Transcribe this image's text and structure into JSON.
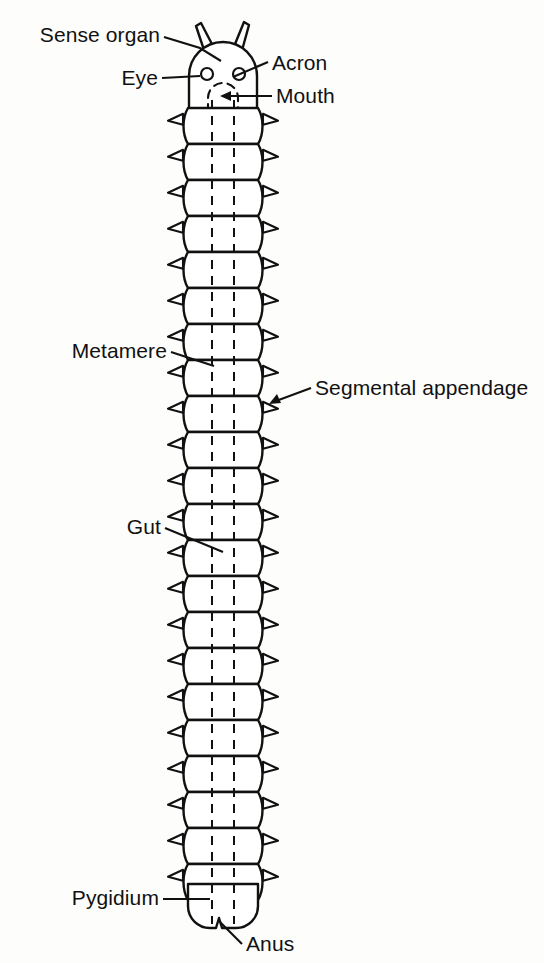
{
  "figure": {
    "title": "Generalized segmented arthropod body plan",
    "organism": "generalized metameric arthropod",
    "background_color": "#fdfdfc",
    "ink_color": "#111111",
    "fill_color": "#ffffff"
  },
  "labels": {
    "sense_organ": "Sense organ",
    "acron": "Acron",
    "eye": "Eye",
    "mouth": "Mouth",
    "metamere": "Metamere",
    "segmental_appendage": "Segmental appendage",
    "gut": "Gut",
    "pygidium": "Pygidium",
    "anus": "Anus"
  },
  "anatomy": {
    "parts": [
      {
        "name": "sense-organ",
        "label": "Sense organ",
        "side": "left",
        "count": 2,
        "description": "paired tapered antenna-like projections on top of the acron"
      },
      {
        "name": "acron",
        "label": "Acron",
        "side": "right",
        "count": 1,
        "description": "anterior presegmental head lobe"
      },
      {
        "name": "eye",
        "label": "Eye",
        "side": "left",
        "count": 2,
        "description": "paired simple circular eyes on the acron"
      },
      {
        "name": "mouth",
        "label": "Mouth",
        "side": "right",
        "count": 1,
        "description": "ventral opening shown as dashed outline below the eyes"
      },
      {
        "name": "metamere",
        "label": "Metamere",
        "side": "left",
        "count": 22,
        "description": "repeating body segment of the trunk"
      },
      {
        "name": "segmental-appendage",
        "label": "Segmental appendage",
        "side": "right",
        "count": 44,
        "description": "paired lateral spine-like appendage, one pair per metamere"
      },
      {
        "name": "gut",
        "label": "Gut",
        "side": "left",
        "count": 1,
        "description": "straight dashed tube running the length of the body"
      },
      {
        "name": "pygidium",
        "label": "Pygidium",
        "side": "left",
        "count": 1,
        "description": "terminal postsegmental region"
      },
      {
        "name": "anus",
        "label": "Anus",
        "side": "right",
        "count": 1,
        "description": "opening at the posterior notch of the pygidium"
      }
    ],
    "metamere_count": 22,
    "body_axis": "anterior at top, posterior at bottom"
  },
  "geometry": {
    "body_left": 188,
    "body_right": 258,
    "body_center_x": 223,
    "segment_height": 36,
    "first_segment_top": 108,
    "segment_count": 22,
    "head_center_y": 76,
    "head_radius": 36,
    "pygidium_top": 884,
    "pygidium_bottom": 932,
    "gut_line_x": [
      212,
      234
    ],
    "gut_top": 100,
    "gut_bottom": 925,
    "eye_left_x": 207,
    "eye_right_x": 239,
    "eye_y": 74,
    "eye_radius": 6
  },
  "label_positions": {
    "sense_organ": {
      "text_x": 160,
      "text_y": 42,
      "leader": "M164,46 L218,62"
    },
    "acron": {
      "text_x": 270,
      "text_y": 70,
      "leader": "M266,62 L234,76"
    },
    "eye": {
      "text_x": 158,
      "text_y": 85,
      "leader": "M162,78 L200,78"
    },
    "mouth": {
      "text_x": 274,
      "text_y": 103,
      "leader": "M270,96 L224,96"
    },
    "metamere": {
      "text_x": 167,
      "text_y": 358,
      "leader": "M171,352 L213,365"
    },
    "segmental_appendage": {
      "text_x": 313,
      "text_y": 395,
      "leader": "M309,388 L268,402"
    },
    "gut": {
      "text_x": 161,
      "text_y": 534,
      "leader": "M165,528 L222,551"
    },
    "pygidium": {
      "text_x": 159,
      "text_y": 905,
      "leader": "M163,899 L208,899"
    },
    "anus": {
      "text_x": 244,
      "text_y": 950,
      "leader": "M240,943 L219,921"
    }
  }
}
